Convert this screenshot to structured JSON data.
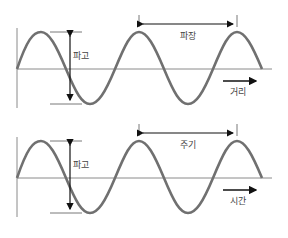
{
  "diagram": {
    "colors": {
      "wave": "#707070",
      "axis": "#8a8a8a",
      "guide": "#555555",
      "arrow": "#111111"
    },
    "panels": [
      {
        "id": "spatial",
        "amplitude_label": "파고",
        "span_label": "파장",
        "axis_label": "거리"
      },
      {
        "id": "temporal",
        "amplitude_label": "파고",
        "span_label": "주기",
        "axis_label": "시간"
      }
    ]
  }
}
